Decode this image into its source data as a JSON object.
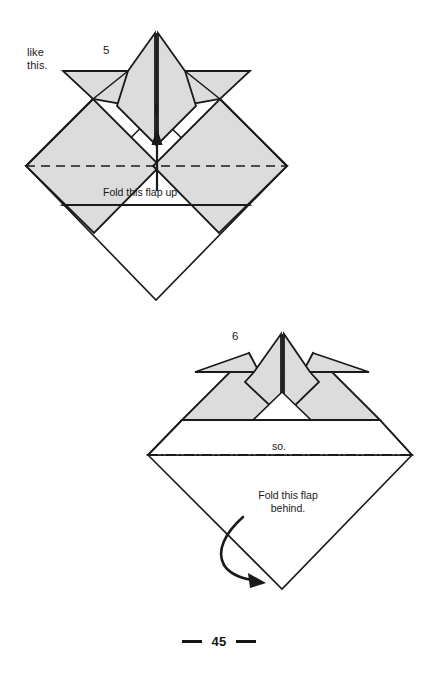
{
  "page": {
    "number": "45",
    "background": "#ffffff",
    "ink": "#1a1a1a",
    "paper_fill": "#dcdcdc",
    "paper_white": "#ffffff"
  },
  "annotations": {
    "like_this": "like\nthis.",
    "fold_up_caption": "Fold this flap up",
    "so_caption": "so.",
    "fold_behind_caption": "Fold this flap\nbehind."
  },
  "steps": [
    {
      "number": "5",
      "caption": "Fold this flap up",
      "lead_in": "like this.",
      "arrow": "straight-up-arrow",
      "fold_line_style": "dashed",
      "diagram": {
        "outer_diamond": {
          "left": [
            26,
            166
          ],
          "right": [
            287,
            166
          ],
          "bottom": [
            156,
            300
          ],
          "top": [
            156,
            33
          ]
        },
        "valley_fold_line_y": 166,
        "horizontal_edge_y": 205
      }
    },
    {
      "number": "6",
      "caption": "Fold this flap\nbehind.",
      "lead_in": "so.",
      "arrow": "curved-behind-arrow",
      "fold_line_style": "dash-dot",
      "diagram": {
        "outer_diamond": {
          "left": [
            148,
            455
          ],
          "right": [
            412,
            455
          ],
          "bottom": [
            282,
            589
          ],
          "top": [
            282,
            334
          ]
        },
        "mountain_fold_line_y": 455,
        "horizontal_edge_y": 420
      }
    }
  ],
  "icons": {
    "up_arrow": "up-arrow-icon",
    "curved_arrow": "curved-arrow-icon",
    "footer_rule": "footer-rule-icon"
  }
}
